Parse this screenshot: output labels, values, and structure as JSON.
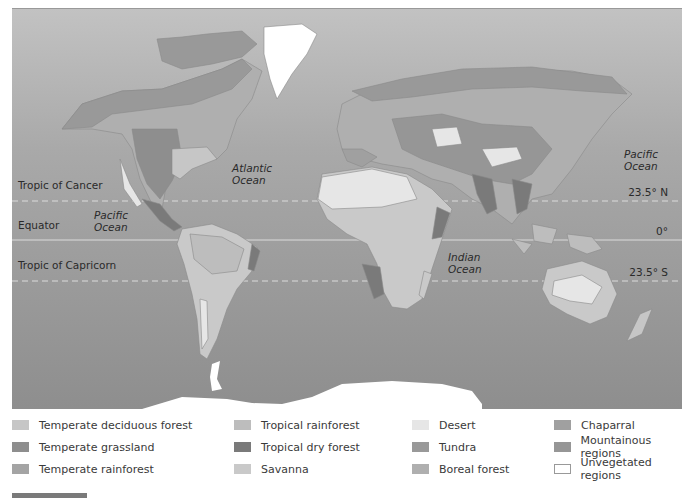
{
  "map": {
    "latitude_lines": [
      {
        "name": "Tropic of Cancer",
        "degree": "23.5° N",
        "style": "dashed"
      },
      {
        "name": "Equator",
        "degree": "0°",
        "style": "solid"
      },
      {
        "name": "Tropic of Capricorn",
        "degree": "23.5° S",
        "style": "dashed"
      }
    ],
    "oceans": [
      {
        "name": "Pacific",
        "name2": "Ocean"
      },
      {
        "name": "Atlantic",
        "name2": "Ocean"
      },
      {
        "name": "Indian",
        "name2": "Ocean"
      },
      {
        "name": "Pacific",
        "name2": "Ocean"
      }
    ]
  },
  "legend": {
    "items": [
      {
        "label": "Temperate deciduous forest",
        "color": "#c6c6c6"
      },
      {
        "label": "Temperate grassland",
        "color": "#8e8e8e"
      },
      {
        "label": "Temperate rainforest",
        "color": "#a4a4a4"
      },
      {
        "label": "Tropical rainforest",
        "color": "#bdbdbd"
      },
      {
        "label": "Tropical dry forest",
        "color": "#7a7a7a"
      },
      {
        "label": "Savanna",
        "color": "#c9c9c9"
      },
      {
        "label": "Desert",
        "color": "#e6e6e6"
      },
      {
        "label": "Tundra",
        "color": "#999999"
      },
      {
        "label": "Boreal forest",
        "color": "#afafaf"
      },
      {
        "label": "Chaparral",
        "color": "#a0a0a0"
      },
      {
        "label": "Mountainous regions",
        "color": "#969696"
      },
      {
        "label": "Unvegetated regions",
        "color": "#ffffff"
      }
    ]
  }
}
